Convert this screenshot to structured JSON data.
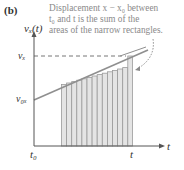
{
  "panel_label": "(b)",
  "caption": {
    "line1": "Displacement x − x₀ between",
    "line2": "t₀ and t is the sum of the",
    "line3": "areas of the narrow rectangles."
  },
  "axes": {
    "y_label": "vₓ(t)",
    "x_label": "t",
    "y_ticks": [
      "vₓ",
      "v₀ₓ"
    ],
    "x_ticks": [
      "t₀",
      "t"
    ]
  },
  "colors": {
    "axis": "#555555",
    "line": "#8f8f8f",
    "rect_fill": "#e4e4e4",
    "rect_stroke": "#9a9a9a",
    "caption_text": "#8a8a8a"
  },
  "rectangles": {
    "count": 14
  }
}
